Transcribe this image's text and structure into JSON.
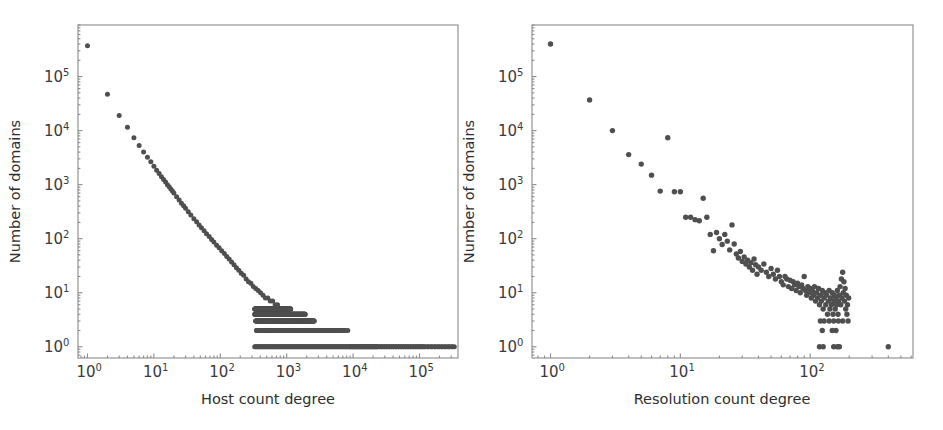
{
  "figure": {
    "background_color": "#ffffff",
    "marker_color": "#4f4f4f",
    "axis_color": "#8a8a8a",
    "text_color": "#2e2e2e",
    "panel_count": 2
  },
  "panels": [
    {
      "id": "left",
      "xlabel": "Host count degree",
      "ylabel": "Number of domains",
      "xticks": [
        "10^0",
        "10^1",
        "10^2",
        "10^3",
        "10^4",
        "10^5"
      ],
      "yticks": [
        "10^0",
        "10^1",
        "10^2",
        "10^3",
        "10^4",
        "10^5"
      ],
      "xtick_mantissas": [
        "10",
        "10",
        "10",
        "10",
        "10",
        "10"
      ],
      "xtick_exponents": [
        "0",
        "1",
        "2",
        "3",
        "4",
        "5"
      ],
      "ytick_mantissas": [
        "10",
        "10",
        "10",
        "10",
        "10",
        "10"
      ],
      "ytick_exponents": [
        "0",
        "1",
        "2",
        "3",
        "4",
        "5"
      ]
    },
    {
      "id": "right",
      "xlabel": "Resolution count degree",
      "ylabel": "Number of domains",
      "xticks": [
        "10^0",
        "10^1",
        "10^2"
      ],
      "yticks": [
        "10^0",
        "10^1",
        "10^2",
        "10^3",
        "10^4",
        "10^5"
      ],
      "xtick_mantissas": [
        "10",
        "10",
        "10"
      ],
      "xtick_exponents": [
        "0",
        "1",
        "2"
      ],
      "ytick_mantissas": [
        "10",
        "10",
        "10",
        "10",
        "10",
        "10"
      ],
      "ytick_exponents": [
        "0",
        "1",
        "2",
        "3",
        "4",
        "5"
      ]
    }
  ],
  "chart_data": [
    {
      "type": "scatter",
      "panel": "left",
      "title": "",
      "xlabel": "Host count degree",
      "ylabel": "Number of domains",
      "xscale": "log",
      "yscale": "log",
      "xlim": [
        0.72,
        380000
      ],
      "ylim": [
        0.62,
        900000
      ],
      "xticks": [
        1,
        10,
        100,
        1000,
        10000,
        100000
      ],
      "ytick_values": [
        1,
        10,
        100,
        1000,
        10000,
        100000
      ],
      "grid": false,
      "legend": false,
      "marker_size": 3.2,
      "description": "Degree distribution of host count degree versus number of domains; heavy-tailed power law with discrete integer plateaus at low counts",
      "points": [
        [
          1,
          370000
        ],
        [
          2,
          47000
        ],
        [
          3,
          19000
        ],
        [
          4,
          11500
        ],
        [
          5,
          7400
        ],
        [
          6,
          5300
        ],
        [
          7,
          4000
        ],
        [
          8,
          3200
        ],
        [
          9,
          2650
        ],
        [
          10,
          2200
        ],
        [
          11,
          1850
        ],
        [
          12,
          1600
        ],
        [
          13,
          1400
        ],
        [
          14,
          1250
        ],
        [
          15,
          1120
        ],
        [
          16,
          1000
        ],
        [
          17,
          910
        ],
        [
          18,
          830
        ],
        [
          19,
          760
        ],
        [
          20,
          700
        ],
        [
          22,
          600
        ],
        [
          24,
          520
        ],
        [
          26,
          455
        ],
        [
          28,
          405
        ],
        [
          30,
          365
        ],
        [
          33,
          315
        ],
        [
          36,
          275
        ],
        [
          40,
          235
        ],
        [
          44,
          205
        ],
        [
          48,
          180
        ],
        [
          52,
          160
        ],
        [
          57,
          140
        ],
        [
          62,
          124
        ],
        [
          68,
          110
        ],
        [
          74,
          97
        ],
        [
          80,
          87
        ],
        [
          88,
          76
        ],
        [
          96,
          68
        ],
        [
          105,
          60
        ],
        [
          115,
          53
        ],
        [
          125,
          47
        ],
        [
          136,
          42
        ],
        [
          148,
          37
        ],
        [
          161,
          33
        ],
        [
          175,
          29
        ],
        [
          190,
          26
        ],
        [
          207,
          23
        ],
        [
          225,
          21
        ],
        [
          245,
          18
        ],
        [
          266,
          16
        ],
        [
          289,
          15
        ],
        [
          314,
          13
        ],
        [
          342,
          12
        ],
        [
          372,
          11
        ],
        [
          404,
          10
        ],
        [
          440,
          9
        ],
        [
          478,
          8
        ],
        [
          520,
          8
        ],
        [
          566,
          7
        ],
        [
          615,
          7
        ],
        [
          670,
          6
        ],
        [
          728,
          6
        ],
        [
          792,
          5
        ],
        [
          862,
          5
        ],
        [
          937,
          5
        ],
        [
          1020,
          4
        ],
        [
          1109,
          4
        ],
        [
          1206,
          4
        ],
        [
          1312,
          3
        ],
        [
          1427,
          3
        ],
        [
          1552,
          3
        ],
        [
          1688,
          3
        ],
        [
          1836,
          2
        ],
        [
          1997,
          2
        ],
        [
          2172,
          2
        ],
        [
          2362,
          2
        ],
        [
          2569,
          2
        ],
        [
          2794,
          2
        ],
        [
          3039,
          2
        ],
        [
          3305,
          2
        ],
        [
          3595,
          2
        ],
        [
          3910,
          2
        ],
        [
          4252,
          2
        ],
        [
          4625,
          2
        ],
        [
          5030,
          2
        ],
        [
          5470,
          2
        ],
        [
          5949,
          2
        ],
        [
          6470,
          2
        ],
        [
          7036,
          2
        ],
        [
          7653,
          2
        ],
        [
          8323,
          2
        ],
        [
          9052,
          1
        ],
        [
          9845,
          1
        ],
        [
          10707,
          1
        ],
        [
          11645,
          1
        ],
        [
          12665,
          1
        ],
        [
          13774,
          1
        ],
        [
          14980,
          1
        ],
        [
          16292,
          1
        ],
        [
          17719,
          1
        ],
        [
          19271,
          1
        ],
        [
          20958,
          1
        ],
        [
          22794,
          1
        ],
        [
          24790,
          1
        ],
        [
          26961,
          1
        ],
        [
          29322,
          1
        ],
        [
          31890,
          1
        ],
        [
          34682,
          1
        ],
        [
          37719,
          1
        ],
        [
          41022,
          1
        ],
        [
          44614,
          1
        ],
        [
          48521,
          1
        ],
        [
          52770,
          1
        ],
        [
          57391,
          1
        ],
        [
          62418,
          1
        ],
        [
          67884,
          1
        ],
        [
          73829,
          1
        ],
        [
          80294,
          1
        ],
        [
          87325,
          1
        ],
        [
          94973,
          1
        ],
        [
          103290,
          1
        ],
        [
          112335,
          1
        ],
        [
          122172,
          1
        ],
        [
          132870,
          1
        ],
        [
          144505,
          1
        ],
        [
          157158,
          1
        ],
        [
          170921,
          1
        ],
        [
          185888,
          1
        ],
        [
          202168,
          1
        ],
        [
          219875,
          1
        ],
        [
          239136,
          1
        ],
        [
          260086,
          1
        ],
        [
          282873,
          1
        ],
        [
          307656,
          1
        ],
        [
          334608,
          1
        ]
      ],
      "plateau_bands": [
        {
          "value": 5,
          "x_from": 330,
          "x_to": 1150
        },
        {
          "value": 4,
          "x_from": 330,
          "x_to": 1900
        },
        {
          "value": 3,
          "x_from": 340,
          "x_to": 2600
        },
        {
          "value": 2,
          "x_from": 350,
          "x_to": 7500
        },
        {
          "value": 1,
          "x_from": 330,
          "x_to": 330000
        }
      ]
    },
    {
      "type": "scatter",
      "panel": "right",
      "title": "",
      "xlabel": "Resolution count degree",
      "ylabel": "Number of domains",
      "xscale": "log",
      "yscale": "log",
      "xlim": [
        0.72,
        620
      ],
      "ylim": [
        0.62,
        900000
      ],
      "xticks": [
        1,
        10,
        100
      ],
      "ytick_values": [
        1,
        10,
        100,
        1000,
        10000,
        100000
      ],
      "grid": false,
      "legend": false,
      "marker_size": 3.6,
      "description": "Degree distribution of resolution count degree versus number of domains; power-law decay with a noisy plateau and an uptick near degree 170",
      "points": [
        [
          1,
          400000
        ],
        [
          2,
          37000
        ],
        [
          3,
          10000
        ],
        [
          4,
          3600
        ],
        [
          5,
          2400
        ],
        [
          6,
          1500
        ],
        [
          7,
          760
        ],
        [
          8,
          7400
        ],
        [
          9,
          740
        ],
        [
          10,
          740
        ],
        [
          11,
          250
        ],
        [
          12,
          250
        ],
        [
          13,
          225
        ],
        [
          14,
          215
        ],
        [
          15,
          560
        ],
        [
          16,
          250
        ],
        [
          17,
          120
        ],
        [
          18,
          60
        ],
        [
          19,
          130
        ],
        [
          20,
          100
        ],
        [
          21,
          78
        ],
        [
          22,
          120
        ],
        [
          23,
          90
        ],
        [
          24,
          62
        ],
        [
          25,
          180
        ],
        [
          26,
          80
        ],
        [
          27,
          52
        ],
        [
          28,
          44
        ],
        [
          29,
          58
        ],
        [
          30,
          38
        ],
        [
          31,
          46
        ],
        [
          32,
          34
        ],
        [
          33,
          40
        ],
        [
          34,
          30
        ],
        [
          35,
          36
        ],
        [
          36,
          26
        ],
        [
          37,
          42
        ],
        [
          38,
          33
        ],
        [
          39,
          22
        ],
        [
          40,
          30
        ],
        [
          42,
          26
        ],
        [
          44,
          34
        ],
        [
          46,
          24
        ],
        [
          48,
          20
        ],
        [
          50,
          28
        ],
        [
          52,
          22
        ],
        [
          54,
          18
        ],
        [
          56,
          26
        ],
        [
          58,
          20
        ],
        [
          60,
          16
        ],
        [
          62,
          14
        ],
        [
          64,
          20
        ],
        [
          66,
          18
        ],
        [
          68,
          13
        ],
        [
          70,
          17
        ],
        [
          72,
          12
        ],
        [
          74,
          16
        ],
        [
          76,
          14
        ],
        [
          78,
          11
        ],
        [
          80,
          15
        ],
        [
          82,
          13
        ],
        [
          84,
          10
        ],
        [
          86,
          14
        ],
        [
          88,
          12
        ],
        [
          90,
          20
        ],
        [
          92,
          11
        ],
        [
          94,
          9
        ],
        [
          96,
          13
        ],
        [
          98,
          10
        ],
        [
          100,
          12
        ],
        [
          102,
          8
        ],
        [
          104,
          11
        ],
        [
          106,
          9
        ],
        [
          108,
          13
        ],
        [
          110,
          7
        ],
        [
          112,
          10
        ],
        [
          114,
          8
        ],
        [
          116,
          12
        ],
        [
          118,
          6
        ],
        [
          120,
          9
        ],
        [
          122,
          7
        ],
        [
          124,
          11
        ],
        [
          126,
          5
        ],
        [
          128,
          8
        ],
        [
          130,
          10
        ],
        [
          132,
          6
        ],
        [
          134,
          9
        ],
        [
          136,
          4
        ],
        [
          138,
          7
        ],
        [
          140,
          11
        ],
        [
          142,
          5
        ],
        [
          144,
          8
        ],
        [
          146,
          6
        ],
        [
          148,
          10
        ],
        [
          150,
          4
        ],
        [
          152,
          7
        ],
        [
          154,
          9
        ],
        [
          156,
          5
        ],
        [
          158,
          8
        ],
        [
          160,
          6
        ],
        [
          162,
          11
        ],
        [
          164,
          4
        ],
        [
          166,
          7
        ],
        [
          168,
          9
        ],
        [
          170,
          13
        ],
        [
          172,
          6
        ],
        [
          174,
          18
        ],
        [
          176,
          8
        ],
        [
          178,
          24
        ],
        [
          180,
          10
        ],
        [
          182,
          16
        ],
        [
          184,
          7
        ],
        [
          186,
          12
        ],
        [
          188,
          5
        ],
        [
          190,
          9
        ],
        [
          192,
          4
        ],
        [
          194,
          6
        ],
        [
          196,
          3
        ],
        [
          198,
          8
        ],
        [
          120,
          3
        ],
        [
          128,
          3
        ],
        [
          140,
          3
        ],
        [
          152,
          3
        ],
        [
          165,
          3
        ],
        [
          178,
          3
        ],
        [
          124,
          2
        ],
        [
          148,
          2
        ],
        [
          158,
          2
        ],
        [
          118,
          1
        ],
        [
          126,
          1
        ],
        [
          152,
          1
        ],
        [
          162,
          1
        ],
        [
          168,
          1
        ],
        [
          400,
          1
        ]
      ]
    }
  ]
}
